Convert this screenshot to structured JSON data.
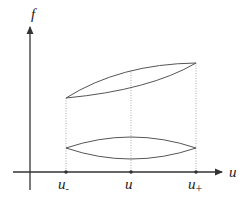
{
  "diagram": {
    "axes": {
      "x_label": "u",
      "y_label": "f"
    },
    "ticks": [
      {
        "id": "u_minus",
        "base": "u",
        "sub": "-"
      },
      {
        "id": "u_mid",
        "base": "u",
        "sub": ""
      },
      {
        "id": "u_plus",
        "base": "u",
        "sub": "+"
      }
    ],
    "colors": {
      "axis": "#333333",
      "curve": "#555555",
      "guide": "#888888"
    },
    "shapes": [
      {
        "name": "upper-lens",
        "description": "two curves joining at (u-, low) and (u+, high)"
      },
      {
        "name": "lower-lens",
        "description": "two symmetric curves joining at u- and u+ at equal height"
      }
    ]
  }
}
